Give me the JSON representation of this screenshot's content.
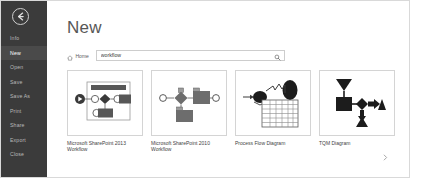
{
  "window": {
    "title": "New"
  },
  "sidebar": {
    "back_button": {
      "icon": "back-arrow-icon"
    },
    "items": [
      {
        "label": "Info",
        "selected": false
      },
      {
        "label": "New",
        "selected": true
      },
      {
        "label": "Open",
        "selected": false
      },
      {
        "label": "Save",
        "selected": false
      },
      {
        "label": "Save As",
        "selected": false
      },
      {
        "label": "Print",
        "selected": false
      },
      {
        "label": "Share",
        "selected": false
      },
      {
        "label": "Export",
        "selected": false
      },
      {
        "label": "Close",
        "selected": false
      }
    ],
    "background_color": "#3b3b3b",
    "selected_color": "#4a4a4a",
    "text_color": "#b9b9b9"
  },
  "header": {
    "page_title": "New"
  },
  "breadcrumb": {
    "home_label": "Home",
    "home_icon": "home-icon"
  },
  "search": {
    "value": "workflow",
    "placeholder": "Search for online templates",
    "icon": "search-icon"
  },
  "templates": [
    {
      "caption": "Microsoft SharePoint 2013 Workflow",
      "thumbnail": "sharepoint-2013-workflow-thumbnail"
    },
    {
      "caption": "Microsoft SharePoint 2010 Workflow",
      "thumbnail": "sharepoint-2010-workflow-thumbnail"
    },
    {
      "caption": "Process Flow Diagram",
      "thumbnail": "process-flow-diagram-thumbnail"
    },
    {
      "caption": "TQM Diagram",
      "thumbnail": "tqm-diagram-thumbnail"
    }
  ],
  "scroll_next": {
    "icon": "chevron-right-icon"
  }
}
